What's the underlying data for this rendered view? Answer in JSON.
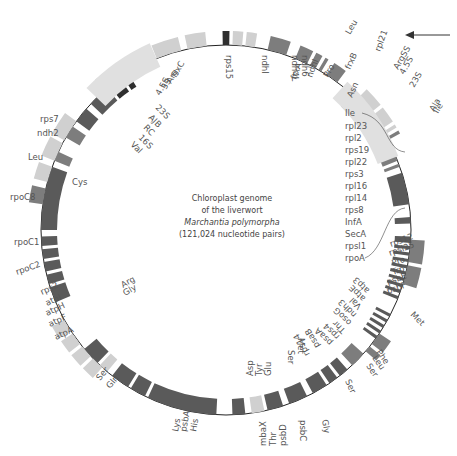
{
  "title": {
    "line1": "Chloroplast genome",
    "line2": "of the liverwort",
    "line3": "Marchantia polymorpha",
    "line4": "(121,024 nucleotide pairs)"
  },
  "colors": {
    "dark": "#595959",
    "darker": "#333333",
    "medium": "#7a7a7a",
    "light": "#d3d3d3",
    "lighter": "#e6e6e6",
    "line": "#222222",
    "label": "#555555"
  },
  "direction_arrow": "counterclockwise-arrow",
  "labels": {
    "top": [
      "rps15",
      "ndhI",
      "ndh4L",
      "ndh6",
      "frxA",
      "ndhI",
      "Pro",
      "Leu",
      "rpl21",
      "frxB",
      "Asn"
    ],
    "top_right": [
      "ArgSS",
      "4.5S",
      "23S",
      "Ala",
      "Ile"
    ],
    "right_list": [
      "Ile",
      "rpl23",
      "rpl2",
      "rps19",
      "rpl22",
      "rps3",
      "rpl16",
      "rpl14",
      "rps8",
      "InfA",
      "SecA",
      "rpsl1",
      "rpoA"
    ],
    "right_inner": [
      "rps12",
      "rpsl25",
      "Pro",
      "Trp",
      "psbE",
      "psbF"
    ],
    "right_lower": [
      "atp3",
      "atpE",
      "Val",
      "ndh3",
      "osoG",
      "Thr",
      "rps4",
      "psaA",
      "psaB",
      "rps14",
      "Met",
      "Met",
      "Phe",
      "Leu",
      "Ser",
      "Ser"
    ],
    "bottom": [
      "Ser",
      "Asp",
      "Tyr",
      "Glu",
      "Gly",
      "psbC",
      "psbD",
      "mbaX",
      "Thr",
      "His",
      "psbA",
      "Lys"
    ],
    "left_lower": [
      "Gln",
      "Ser",
      "Arg",
      "Gly",
      "atpA",
      "atpF",
      "atpH",
      "atpI",
      "rps2",
      "rpoC2",
      "rpoC1",
      "rpoC8",
      "Cys"
    ],
    "left_upper": [
      "Leu",
      "ndh2",
      "rps7",
      "Val",
      "16S",
      "RC",
      "AJB",
      "23S",
      "4.5S",
      "5S",
      "Arg",
      "frxC"
    ]
  }
}
